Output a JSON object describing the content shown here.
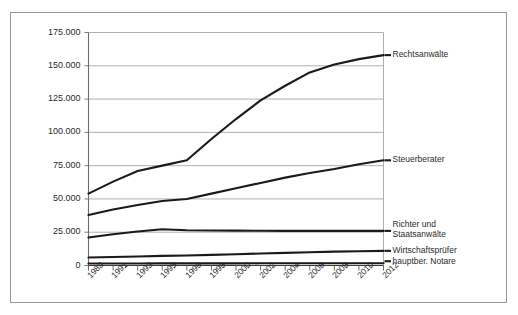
{
  "chart_data": {
    "type": "line",
    "title": "",
    "subtitle": "",
    "xlabel": "",
    "ylabel": "",
    "grid": true,
    "legend_position": "right-inline-labels",
    "ylim": [
      0,
      175000
    ],
    "yticks": [
      0,
      25000,
      50000,
      75000,
      100000,
      125000,
      150000,
      175000
    ],
    "ytick_labels": [
      "0",
      "25.000",
      "50.000",
      "75.000",
      "100.000",
      "125.000",
      "150.000",
      "175.000"
    ],
    "categories": [
      "1989",
      "1991",
      "1993",
      "1995",
      "1996",
      "1998",
      "2000",
      "2002",
      "2004",
      "2006",
      "2008",
      "2010",
      "2012"
    ],
    "series": [
      {
        "name": "Rechtsanwälte",
        "color": "#1a1a1a",
        "values": [
          54000,
          63000,
          71000,
          75000,
          79000,
          95000,
          110000,
          124000,
          135000,
          145000,
          151000,
          155000,
          158000
        ]
      },
      {
        "name": "Steuerberater",
        "color": "#1a1a1a",
        "values": [
          38000,
          42000,
          45500,
          48500,
          50000,
          54000,
          58000,
          62000,
          66000,
          69500,
          72500,
          76000,
          79000
        ]
      },
      {
        "name": "Richter und Staatsanwälte",
        "color": "#1a1a1a",
        "values": [
          21000,
          23500,
          25500,
          27200,
          26500,
          26300,
          26200,
          26100,
          26000,
          26000,
          26000,
          26000,
          26000
        ]
      },
      {
        "name": "Wirtschaftsprüfer",
        "color": "#1a1a1a",
        "values": [
          6000,
          6400,
          6800,
          7200,
          7500,
          8000,
          8500,
          9000,
          9500,
          10000,
          10400,
          10700,
          11000
        ]
      },
      {
        "name": "hauptber. Notare",
        "color": "#1a1a1a",
        "values": [
          1500,
          1520,
          1550,
          1570,
          1580,
          1600,
          1620,
          1640,
          1660,
          1680,
          1700,
          1700,
          1700
        ]
      }
    ]
  }
}
